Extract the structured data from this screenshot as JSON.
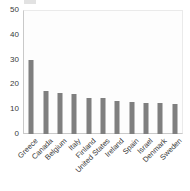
{
  "chart_data": {
    "type": "bar",
    "title": "",
    "subtitle": "",
    "xlabel": "",
    "ylabel": "",
    "categories": [
      "Greece",
      "Canada",
      "Belgium",
      "Italy",
      "Finland",
      "United States",
      "Ireland",
      "Spain",
      "Israel",
      "Denmark",
      "Sweden"
    ],
    "values": [
      30,
      17.5,
      16.5,
      16,
      14.5,
      14.5,
      13.5,
      13,
      12.5,
      12.5,
      12
    ],
    "ylim": [
      0,
      50
    ],
    "yticks": [
      0,
      10,
      20,
      30,
      40,
      50
    ],
    "ytick_labels": [
      "0",
      "10",
      "20",
      "30",
      "40",
      "50"
    ],
    "grid": false,
    "legend": false,
    "legend_position": "none",
    "bar_color": "#7f7f7f",
    "plot_background": "#fdfdfd",
    "axis_color": "#c9c9c9",
    "text_color": "#3a3a3a"
  }
}
